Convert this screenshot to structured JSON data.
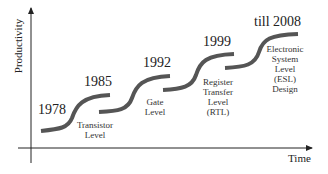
{
  "axes": {
    "y_label": "Productivity",
    "x_label": "Time"
  },
  "stages": [
    {
      "year": "1978",
      "label": ""
    },
    {
      "year": "1985",
      "label": "Transistor Level"
    },
    {
      "year": "1992",
      "label": "Gate Level"
    },
    {
      "year": "1999",
      "label": "Register Transfer Level (RTL)"
    },
    {
      "year": "till 2008",
      "label": "Electronic System Level (ESL) Design"
    }
  ],
  "labels": {
    "transistor": [
      "Transistor",
      "Level"
    ],
    "gate": [
      "Gate",
      "Level"
    ],
    "rtl": [
      "Register",
      "Transfer",
      "Level",
      "(RTL)"
    ],
    "esl": [
      "Electronic",
      "System",
      "Level",
      "(ESL)",
      "Design"
    ]
  },
  "colors": {
    "curve": "#555555",
    "axis": "#222222"
  }
}
